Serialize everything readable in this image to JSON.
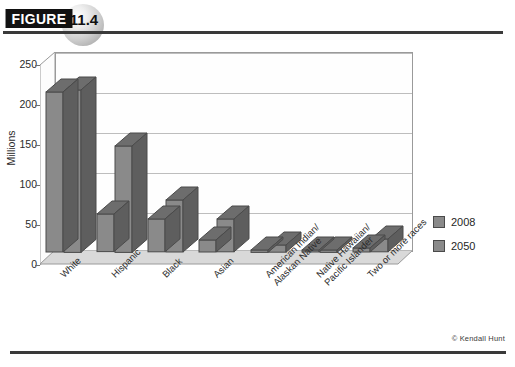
{
  "figure": {
    "tag_label": "FIGURE",
    "number": "11.4"
  },
  "credit": "© Kendall Hunt",
  "chart_data": {
    "type": "bar",
    "title": "",
    "xlabel": "",
    "ylabel": "Millions",
    "ylim": [
      0,
      250
    ],
    "yticks": [
      "0",
      "50",
      "100",
      "150",
      "200",
      "250"
    ],
    "grid": true,
    "legend_position": "right",
    "categories": [
      "White",
      "Hispanic",
      "Black",
      "Asian",
      "American Indian/\nAlaskan Native",
      "Native Hawaiian/\nPacific Islander",
      "Two or more races"
    ],
    "category_lines": [
      [
        "White"
      ],
      [
        "Hispanic"
      ],
      [
        "Black"
      ],
      [
        "Asian"
      ],
      [
        "American Indian/",
        "Alaskan Native"
      ],
      [
        "Native Hawaiian/",
        "Pacific Islander"
      ],
      [
        "Two or more races"
      ]
    ],
    "series": [
      {
        "name": "2008",
        "values": [
          200,
          47,
          41,
          15,
          3,
          1,
          5
        ]
      },
      {
        "name": "2050",
        "values": [
          203,
          133,
          65,
          41,
          9,
          3,
          16
        ]
      }
    ]
  },
  "colors": {
    "bar_front": "#8a8a8a",
    "bar_top": "#6d6d6d",
    "bar_side": "#5e5e5e",
    "bar_outline": "#4a4a4a",
    "floor": "#d9d9d9",
    "wall": "#fefefe",
    "grid": "#bdbdbd",
    "axis": "#9a9a9a",
    "rule": "#3a3a3a"
  }
}
